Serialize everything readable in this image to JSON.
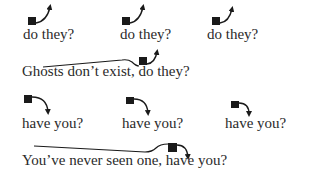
{
  "diagram": {
    "colors": {
      "ink": "#2a2a2a",
      "square": "#1a1a1a",
      "background": "#ffffff"
    },
    "rows": [
      {
        "intonation": "rising",
        "items": [
          {
            "text": "do they?",
            "x": 23,
            "y": 27
          },
          {
            "text": "do they?",
            "x": 120,
            "y": 27
          },
          {
            "text": "do they?",
            "x": 207,
            "y": 27
          }
        ]
      },
      {
        "intonation": "rising",
        "items": [
          {
            "text": "Ghosts don’t exist, do they?",
            "x": 22,
            "y": 64
          }
        ]
      },
      {
        "intonation": "falling",
        "items": [
          {
            "text": "have you?",
            "x": 22,
            "y": 116
          },
          {
            "text": "have you?",
            "x": 122,
            "y": 116
          },
          {
            "text": "have you?",
            "x": 225,
            "y": 116
          }
        ]
      },
      {
        "intonation": "falling",
        "items": [
          {
            "text": "You’ve never seen one, have you?",
            "x": 22,
            "y": 153
          }
        ]
      }
    ]
  }
}
